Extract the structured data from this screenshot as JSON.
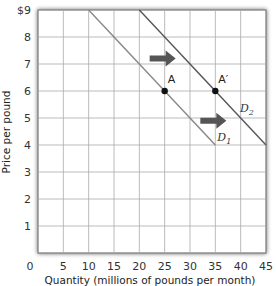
{
  "chart_data": {
    "type": "line",
    "title": "",
    "xlabel": "Quantity (millions of pounds per month)",
    "ylabel": "Price per pound",
    "xlim": [
      0,
      45
    ],
    "ylim": [
      0,
      9
    ],
    "x_ticks": [
      "0",
      "5",
      "10",
      "15",
      "20",
      "25",
      "30",
      "35",
      "40",
      "45"
    ],
    "y_ticks": [
      "1",
      "2",
      "3",
      "4",
      "5",
      "6",
      "7",
      "8",
      "$9"
    ],
    "grid": true,
    "series": [
      {
        "name": "D1",
        "label_main": "D",
        "label_sub": "1",
        "x": [
          10,
          35
        ],
        "y": [
          9,
          4
        ],
        "color": "#888888"
      },
      {
        "name": "D2",
        "label_main": "D",
        "label_sub": "2",
        "x": [
          20,
          45
        ],
        "y": [
          9,
          4
        ],
        "color": "#555555"
      }
    ],
    "points": [
      {
        "label": "A",
        "x": 25,
        "y": 6
      },
      {
        "label": "A′",
        "x": 35,
        "y": 6
      }
    ],
    "annotations": [
      {
        "type": "arrow",
        "direction": "right",
        "x": 25,
        "y": 7.2
      },
      {
        "type": "arrow",
        "direction": "right",
        "x": 35,
        "y": 4.9
      }
    ]
  },
  "axes": {
    "xlabel": "Quantity (millions of pounds per month)",
    "ylabel": "Price per pound"
  }
}
